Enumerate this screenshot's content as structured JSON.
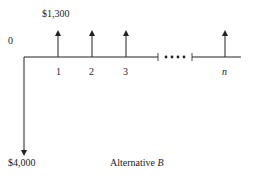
{
  "diagram": {
    "type": "cash-flow-diagram",
    "caption_prefix": "Alternative ",
    "caption_var": "B",
    "origin_label": "0",
    "receipt_label": "$1,300",
    "outlay_label": "$4,000",
    "periods": [
      "1",
      "2",
      "3",
      "n"
    ],
    "receipts": [
      {
        "period": "1",
        "amount": 1300,
        "direction": "up"
      },
      {
        "period": "2",
        "amount": 1300,
        "direction": "up"
      },
      {
        "period": "3",
        "amount": 1300,
        "direction": "up"
      },
      {
        "period": "n",
        "amount": 1300,
        "direction": "up"
      }
    ],
    "outlay": {
      "period": "0",
      "amount": 4000,
      "direction": "down"
    },
    "ellipsis": "• • • •"
  }
}
